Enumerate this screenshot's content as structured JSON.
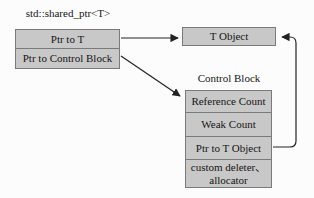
{
  "diagram_title": "std::shared_ptr<T> memory layout",
  "shared_ptr": {
    "title": "std::shared_ptr<T>",
    "rows": [
      [
        "Ptr to T"
      ],
      [
        "Ptr to Control Block"
      ]
    ]
  },
  "t_object": {
    "label": "T Object"
  },
  "control_block": {
    "title": "Control Block",
    "rows": [
      [
        "Reference Count"
      ],
      [
        "Weak Count"
      ],
      [
        "Ptr to T Object"
      ],
      [
        "custom deleter、",
        "allocator"
      ]
    ]
  },
  "edges": [
    {
      "from": "Ptr to T",
      "to": "T Object",
      "style": "straight-arrow"
    },
    {
      "from": "Ptr to Control Block",
      "to": "Control Block",
      "style": "diagonal-arrow"
    },
    {
      "from": "Ptr to T Object",
      "to": "T Object",
      "style": "right-side-elbow-arrow"
    }
  ],
  "colors": {
    "background": "#fcfcfc",
    "box_fill": "#c8c8c8",
    "box_border": "#7a7a7a",
    "line": "#222222",
    "text": "#151515"
  }
}
